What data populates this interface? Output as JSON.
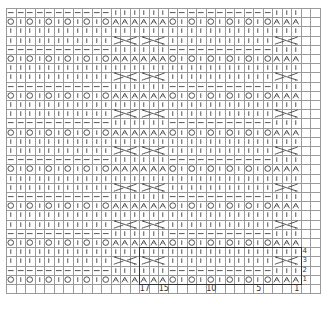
{
  "chart": {
    "title": "",
    "cols": 31,
    "rows": 30,
    "extra_cols": 2,
    "cell_w": 9.5,
    "cell_h": 9.2,
    "symbols": {
      "knit": "|",
      "purl": "—",
      "yarn_over": "O",
      "decrease": "λ",
      "cable": "cable"
    },
    "row_patterns": {
      "row_mod_1": "OOOOOO|KKKKKK|O|OOOOO|KKK",
      "description": "row 1 (≡1 mod 4): yarn-over/decrease row; row 2: purl row; row 3: cable row; row 4: knit row"
    },
    "pattern_rows": {
      "r1": [
        "O",
        "|",
        "O",
        "|",
        "O",
        "|",
        "O",
        "|",
        "O",
        "|",
        "O",
        "λ",
        "λ",
        "λ",
        "λ",
        "λ",
        "λ",
        "O",
        "|",
        "O",
        "|",
        "O",
        "|",
        "O",
        "|",
        "O",
        "|",
        "O",
        "λ",
        "λ",
        "λ"
      ],
      "r2": [
        "—",
        "—",
        "—",
        "—",
        "—",
        "—",
        "—",
        "—",
        "—",
        "—",
        "—",
        "|",
        "|",
        "|",
        "|",
        "|",
        "|",
        "—",
        "—",
        "—",
        "—",
        "—",
        "—",
        "—",
        "—",
        "—",
        "—",
        "—",
        "|",
        "|",
        "|"
      ],
      "r3": [
        "|",
        "|",
        "|",
        "|",
        "|",
        "|",
        "|",
        "|",
        "|",
        "|",
        "|",
        "C",
        "C",
        "C",
        "C",
        "C",
        "C",
        "|",
        "|",
        "|",
        "|",
        "|",
        "|",
        "|",
        "|",
        "|",
        "|",
        "|",
        "C",
        "C",
        "C"
      ],
      "r4": [
        "|",
        "|",
        "|",
        "|",
        "|",
        "|",
        "|",
        "|",
        "|",
        "|",
        "|",
        "|",
        "|",
        "|",
        "|",
        "|",
        "|",
        "|",
        "|",
        "|",
        "|",
        "|",
        "|",
        "|",
        "|",
        "|",
        "|",
        "|",
        "|",
        "|",
        "|"
      ]
    },
    "cables": [
      {
        "start_col": 11,
        "width": 3
      },
      {
        "start_col": 14,
        "width": 3
      },
      {
        "start_col": 28,
        "width": 3
      }
    ],
    "repeat_box": {
      "start_col": 14,
      "end_col": 30,
      "start_row": 1,
      "end_row": 4
    },
    "stitch_numbers": [
      {
        "label": "17",
        "col": 14
      },
      {
        "label": "15",
        "col": 16
      },
      {
        "label": "10",
        "col": 21
      },
      {
        "label": "5",
        "col": 26
      },
      {
        "label": "1",
        "col": 30
      }
    ],
    "row_numbers": [
      {
        "label": "1",
        "row": 1
      },
      {
        "label": "2",
        "row": 2
      },
      {
        "label": "3",
        "row": 3
      },
      {
        "label": "4",
        "row": 4
      }
    ]
  }
}
